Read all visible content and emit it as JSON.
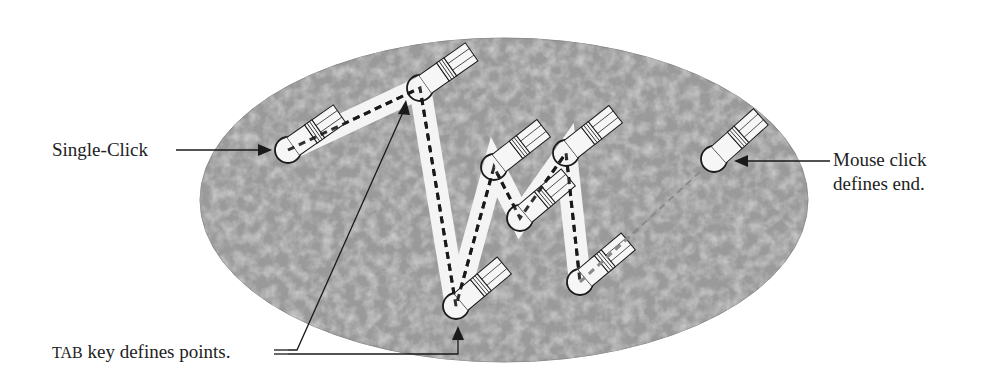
{
  "diagram": {
    "type": "polyline-drawing-illustration",
    "colors": {
      "background": "#ffffff",
      "region_fill": "#9a9a9a",
      "region_texture_light": "#c4c4c4",
      "region_texture_dark": "#7e7e7e",
      "path_band": "#f4f4f4",
      "stroke": "#1a1a1a",
      "dashed_path": "#1a1a1a",
      "rubber_band": "#8a8a8a"
    },
    "labels": {
      "single_click": "Single-Click",
      "mouse_click_line1": "Mouse click",
      "mouse_click_line2": "defines end.",
      "tab_key_prefix": "TAB",
      "tab_key_rest": " key defines points."
    },
    "points": [
      {
        "name": "start",
        "x": 288,
        "y": 150,
        "kind": "single-click"
      },
      {
        "name": "p1",
        "x": 420,
        "y": 88,
        "kind": "tab"
      },
      {
        "name": "p2",
        "x": 456,
        "y": 306,
        "kind": "tab"
      },
      {
        "name": "p3",
        "x": 494,
        "y": 167,
        "kind": "tab"
      },
      {
        "name": "p4",
        "x": 520,
        "y": 218,
        "kind": "tab"
      },
      {
        "name": "p5",
        "x": 566,
        "y": 153,
        "kind": "tab"
      },
      {
        "name": "p6",
        "x": 580,
        "y": 282,
        "kind": "tab"
      },
      {
        "name": "end",
        "x": 714,
        "y": 159,
        "kind": "mouse-click"
      }
    ]
  }
}
